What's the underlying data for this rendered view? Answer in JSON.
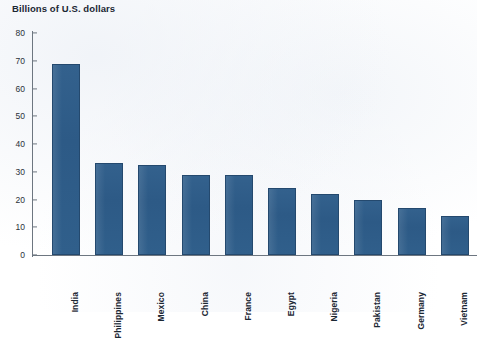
{
  "chart_data": {
    "type": "bar",
    "title": "Billions of U.S. dollars",
    "xlabel": "",
    "ylabel": "Billions of U.S. dollars",
    "ylim": [
      0,
      80
    ],
    "yticks": [
      0,
      10,
      20,
      30,
      40,
      50,
      60,
      70,
      80
    ],
    "ytick_labels": [
      "0",
      "10",
      "20",
      "30",
      "40",
      "50",
      "60",
      "70",
      "80"
    ],
    "grid": false,
    "legend": "none",
    "bar_color": "#2f5f8c",
    "bar_edge_color": "#24496e",
    "categories": [
      "India",
      "Philippines",
      "Mexico",
      "China",
      "France",
      "Egypt",
      "Nigeria",
      "Pakistan",
      "Germany",
      "Vietnam"
    ],
    "values": [
      69,
      33,
      32.5,
      29,
      29,
      24,
      22,
      20,
      17,
      14
    ],
    "series": [
      {
        "name": "Remittance inflows",
        "values": [
          69,
          33,
          32.5,
          29,
          29,
          24,
          22,
          20,
          17,
          14
        ]
      }
    ]
  },
  "axis": {
    "y_axis_color": "#6d7680",
    "x_axis_color": "#6d7680"
  }
}
